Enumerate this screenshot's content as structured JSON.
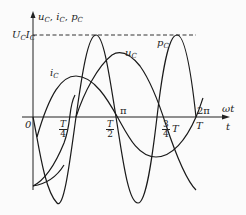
{
  "diagram": {
    "y_axis_label": "u_C, i_C, p_C",
    "y_axis_label_parts": {
      "u": "u",
      "u_sub": "C",
      "i": "i",
      "i_sub": "C",
      "p": "p",
      "p_sub": "C",
      "sep": ","
    },
    "peak_label": {
      "U": "U",
      "U_sub": "C",
      "I": "I",
      "I_sub": "C"
    },
    "x_axis_labels": {
      "omega_t": "ωt",
      "t": "t"
    },
    "origin": "0",
    "ticks": {
      "quarter": {
        "num": "T",
        "den": "4"
      },
      "half": {
        "num": "T",
        "den": "2"
      },
      "pi": "π",
      "three_quarter": {
        "num": "3",
        "den": "4",
        "suffix": "T"
      },
      "two_pi": "2π",
      "T": "T"
    },
    "curve_labels": {
      "i_C": {
        "base": "i",
        "sub": "C"
      },
      "u_C": {
        "base": "u",
        "sub": "C"
      },
      "p_C": {
        "base": "p",
        "sub": "C"
      }
    },
    "curves": [
      {
        "name": "i_C",
        "description": "current through capacitor, cosine, leads voltage by 90°"
      },
      {
        "name": "u_C",
        "description": "capacitor voltage, sine"
      },
      {
        "name": "p_C",
        "description": "instantaneous power, double frequency, amplitude U_C·I_C"
      }
    ],
    "stroke_color": "#1a1a1a",
    "dash_color": "#333333"
  }
}
